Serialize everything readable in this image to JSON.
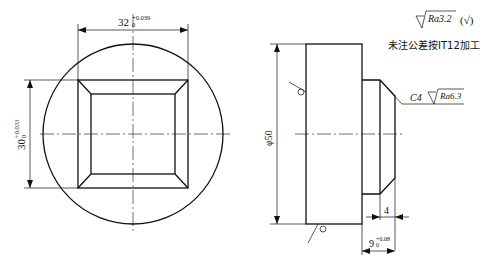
{
  "front_view": {
    "width_dim": {
      "base": "32",
      "upper": "+0.039",
      "lower": "0"
    },
    "height_dim": {
      "base": "30",
      "upper": "+0.033",
      "lower": "0"
    }
  },
  "side_view": {
    "diameter_dim": "φ50",
    "chamfer_note": "C4",
    "chamfer_roughness": "Ra6.3",
    "step_dim": "4",
    "length_dim": {
      "base": "9",
      "upper": "+0.08",
      "lower": "0"
    }
  },
  "notes": {
    "default_roughness": "Ra3.2",
    "default_roughness_suffix": "(√)",
    "tolerance_note": "未注公差按IT12加工"
  }
}
